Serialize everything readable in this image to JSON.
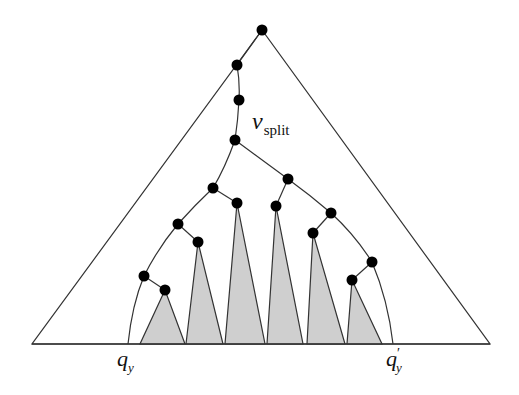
{
  "diagram": {
    "labels": {
      "split_main": "v",
      "split_sub": "split",
      "left_main": "q",
      "left_sub": "y",
      "right_main": "q",
      "right_prime": "′",
      "right_sub": "y"
    },
    "colors": {
      "line": "#333333",
      "node": "#000000",
      "subtree_fill": "#cfcfcf"
    },
    "outer_triangle": {
      "apex": [
        262,
        30
      ],
      "left": [
        32,
        344
      ],
      "right": [
        490,
        344
      ]
    },
    "search_path_nodes": [
      [
        262,
        30
      ],
      [
        237,
        65
      ],
      [
        239,
        100
      ],
      [
        235,
        140
      ]
    ],
    "left_path_nodes": [
      [
        213,
        188
      ],
      [
        178,
        224
      ],
      [
        144,
        276
      ]
    ],
    "right_path_nodes": [
      [
        288,
        179
      ],
      [
        331,
        213
      ],
      [
        372,
        262
      ]
    ],
    "selected_subtree_roots": [
      [
        165,
        290
      ],
      [
        198,
        242
      ],
      [
        237,
        203
      ],
      [
        276,
        206
      ],
      [
        313,
        233
      ],
      [
        352,
        280
      ]
    ],
    "subtrees": [
      {
        "root": [
          165,
          290
        ],
        "left": 140,
        "right": 185
      },
      {
        "root": [
          198,
          242
        ],
        "left": 186,
        "right": 223
      },
      {
        "root": [
          237,
          203
        ],
        "left": 225,
        "right": 265
      },
      {
        "root": [
          276,
          206
        ],
        "left": 267,
        "right": 303
      },
      {
        "root": [
          313,
          233
        ],
        "left": 307,
        "right": 345
      },
      {
        "root": [
          352,
          280
        ],
        "left": 347,
        "right": 382
      }
    ],
    "leaf_endpoints": {
      "q_y": [
        128,
        344
      ],
      "q_prime_y": [
        393,
        344
      ]
    }
  }
}
